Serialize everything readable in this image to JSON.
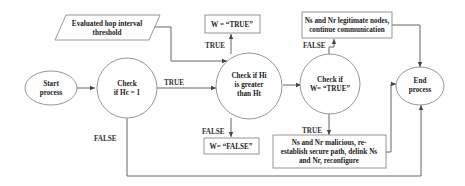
{
  "nodes": {
    "start": {
      "lines": [
        "Start",
        "process"
      ],
      "shape": "ellipse"
    },
    "check_hc": {
      "lines": [
        "Check",
        "if Hc = 1"
      ],
      "shape": "circle"
    },
    "threshold": {
      "lines": [
        "Evaluated  hop interval",
        "threshold"
      ],
      "shape": "parallelogram"
    },
    "check_hi": {
      "lines": [
        "Check if Hi",
        "is greater",
        "than Ht"
      ],
      "shape": "circle"
    },
    "w_true": {
      "lines": [
        "W = “TRUE”"
      ],
      "shape": "rectangle"
    },
    "w_false": {
      "lines": [
        "W= “FALSE”"
      ],
      "shape": "rectangle"
    },
    "check_w": {
      "lines": [
        "Check if",
        "W= “TRUE”"
      ],
      "shape": "circle"
    },
    "legit": {
      "lines": [
        "Ns and Nr legitimate nodes,",
        "continue communication"
      ],
      "shape": "rectangle"
    },
    "malicious": {
      "lines": [
        "Ns and Nr malicious, re-",
        "establish secure path, delink Ns",
        "and Nr, reconfigure"
      ],
      "shape": "rectangle"
    },
    "end": {
      "lines": [
        "End",
        "process"
      ],
      "shape": "ellipse"
    }
  },
  "edge_labels": {
    "hc_true": "TRUE",
    "hc_false": "FALSE",
    "hi_true": "TRUE",
    "hi_false": "FALSE",
    "w_false": "FALSE",
    "w_true": "TRUE"
  },
  "colors": {
    "stroke": "#8a8a8a",
    "line": "#555555",
    "text": "#222222"
  }
}
